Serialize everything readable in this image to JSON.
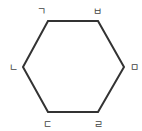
{
  "diagram": {
    "shape": "regular hexagon",
    "stroke_color": "#333333",
    "label_color": "#444444",
    "vertices": [
      {
        "id": "top-left",
        "label": "ㄱ"
      },
      {
        "id": "top-right",
        "label": "ㅂ"
      },
      {
        "id": "right",
        "label": "ㅁ"
      },
      {
        "id": "bottom-right",
        "label": "ㄹ"
      },
      {
        "id": "bottom-left",
        "label": "ㄷ"
      },
      {
        "id": "left",
        "label": "ㄴ"
      }
    ]
  }
}
